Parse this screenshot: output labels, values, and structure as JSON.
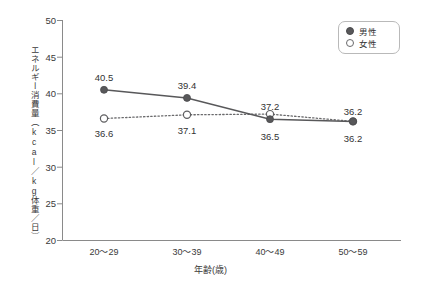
{
  "chart_data": {
    "type": "line",
    "title": "",
    "subtitle": "",
    "xlabel": "年齢(歳)",
    "ylabel": "エネルギー消費量（kcal／kg体重／日）",
    "categories": [
      "20〜29",
      "30〜39",
      "40〜49",
      "50〜59"
    ],
    "xlim": [
      0,
      3
    ],
    "ylim": [
      20,
      50
    ],
    "yticks": [
      20,
      25,
      30,
      35,
      40,
      45,
      50
    ],
    "ytick_labels": [
      "20",
      "25",
      "30",
      "35",
      "40",
      "45",
      "50"
    ],
    "grid": false,
    "legend_position": "top-right",
    "series": [
      {
        "name": "男性",
        "values": [
          40.5,
          39.4,
          36.5,
          36.2
        ],
        "labels": [
          "40.5",
          "39.4",
          "36.5",
          "36.2"
        ],
        "marker": "filled-circle",
        "line_style": "solid",
        "color": "#58585a"
      },
      {
        "name": "女性",
        "values": [
          36.6,
          37.1,
          37.2,
          36.2
        ],
        "labels": [
          "36.6",
          "37.1",
          "37.2",
          "36.2"
        ],
        "marker": "open-circle",
        "line_style": "dotted",
        "color": "#6a6a6c"
      }
    ],
    "annotations": []
  },
  "legend": {
    "items": [
      {
        "label": "男性",
        "marker": "filled-circle"
      },
      {
        "label": "女性",
        "marker": "open-circle"
      }
    ]
  },
  "colors": {
    "male": "#58585a",
    "female": "#6a6a6c",
    "axis": "#8a8a8a",
    "text": "#3a3a3a",
    "background": "#ffffff"
  }
}
